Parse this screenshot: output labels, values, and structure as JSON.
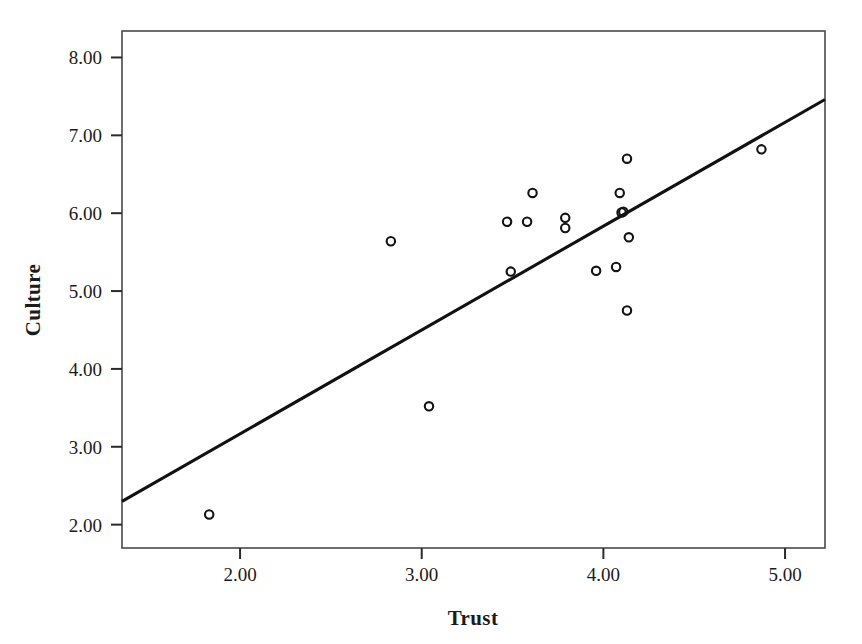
{
  "chart_data": {
    "type": "scatter",
    "title": "",
    "xlabel": "Trust",
    "ylabel": "Culture",
    "xlim": [
      1.35,
      5.22
    ],
    "ylim": [
      1.7,
      8.34
    ],
    "grid": false,
    "legend": "none",
    "x_ticks": [
      "2.00",
      "3.00",
      "4.00",
      "5.00"
    ],
    "x_tick_values": [
      2.0,
      3.0,
      4.0,
      5.0
    ],
    "y_ticks": [
      "2.00",
      "3.00",
      "4.00",
      "5.00",
      "6.00",
      "7.00",
      "8.00"
    ],
    "y_tick_values": [
      2.0,
      3.0,
      4.0,
      5.0,
      6.0,
      7.0,
      8.0
    ],
    "marker_style": "open-circle",
    "points": [
      {
        "x": 1.83,
        "y": 2.13
      },
      {
        "x": 3.04,
        "y": 3.52
      },
      {
        "x": 2.83,
        "y": 5.64
      },
      {
        "x": 3.49,
        "y": 5.25
      },
      {
        "x": 3.47,
        "y": 5.89
      },
      {
        "x": 3.58,
        "y": 5.89
      },
      {
        "x": 3.61,
        "y": 6.26
      },
      {
        "x": 3.79,
        "y": 5.94
      },
      {
        "x": 3.79,
        "y": 5.81
      },
      {
        "x": 3.96,
        "y": 5.26
      },
      {
        "x": 4.07,
        "y": 5.31
      },
      {
        "x": 4.09,
        "y": 6.26
      },
      {
        "x": 4.1,
        "y": 6.01
      },
      {
        "x": 4.11,
        "y": 6.02
      },
      {
        "x": 4.13,
        "y": 6.7
      },
      {
        "x": 4.14,
        "y": 5.69
      },
      {
        "x": 4.13,
        "y": 4.75
      },
      {
        "x": 4.87,
        "y": 6.82
      }
    ],
    "fit_line": {
      "type": "linear-regression",
      "x_start": 1.35,
      "y_start": 2.3,
      "x_end": 5.22,
      "y_end": 7.46
    },
    "colors": {
      "marker_stroke": "#131313",
      "fit_line": "#111111",
      "frame": "#4a4a4a",
      "text": "#1b1b1b",
      "background": "#ffffff"
    }
  }
}
